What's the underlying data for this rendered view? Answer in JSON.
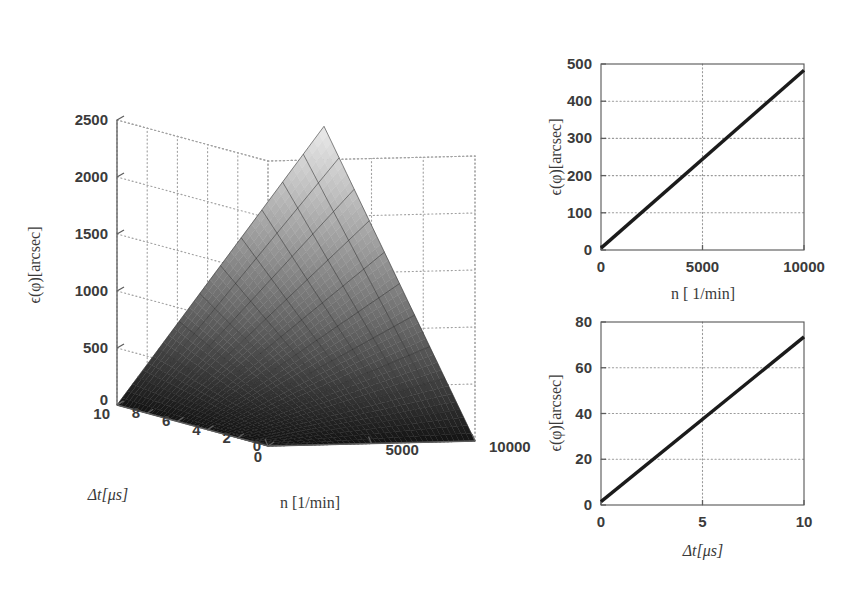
{
  "figure": {
    "background": "#ffffff",
    "panels": [
      "surface3d",
      "line_n",
      "line_dt"
    ]
  },
  "chart_data": [
    {
      "id": "surface3d",
      "type": "surface",
      "title": "",
      "xlabel": "n [1/min]",
      "ylabel": "Δt[μs]",
      "zlabel": "ϵ(φ)[arcsec]",
      "xlim": [
        0,
        10000
      ],
      "ylim": [
        0,
        10
      ],
      "zlim": [
        0,
        2500
      ],
      "xticks": [
        0,
        5000,
        10000
      ],
      "xticklabels": [
        "0",
        "5000",
        "10000"
      ],
      "yticks": [
        0,
        2,
        4,
        6,
        8,
        10
      ],
      "yticklabels": [
        "0",
        "2",
        "4",
        "6",
        "8",
        "10"
      ],
      "zticks": [
        0,
        500,
        1000,
        1500,
        2000,
        2500
      ],
      "zticklabels": [
        "0",
        "500",
        "1000",
        "1500",
        "2000",
        "2500"
      ],
      "grid": true,
      "colormap": "gray",
      "mesh_nx": 11,
      "mesh_ny": 11,
      "relation": "z = 0.02401 * n * dt  (arcsec); z(10000,10) = 2400",
      "surface_values_rows_dt_cols_n": [
        [
          0,
          0,
          0,
          0,
          0,
          0,
          0,
          0,
          0,
          0,
          0
        ],
        [
          0,
          24,
          48,
          72,
          96,
          120,
          144,
          168,
          192,
          216,
          240
        ],
        [
          0,
          48,
          96,
          144,
          192,
          240,
          288,
          336,
          384,
          432,
          480
        ],
        [
          0,
          72,
          144,
          216,
          288,
          360,
          432,
          504,
          576,
          648,
          720
        ],
        [
          0,
          96,
          192,
          288,
          384,
          480,
          576,
          672,
          768,
          864,
          960
        ],
        [
          0,
          120,
          240,
          360,
          480,
          600,
          720,
          840,
          960,
          1080,
          1200
        ],
        [
          0,
          144,
          288,
          432,
          576,
          720,
          864,
          1008,
          1152,
          1296,
          1440
        ],
        [
          0,
          168,
          336,
          504,
          672,
          840,
          1008,
          1176,
          1344,
          1512,
          1680
        ],
        [
          0,
          192,
          384,
          576,
          768,
          960,
          1152,
          1344,
          1536,
          1728,
          1920
        ],
        [
          0,
          216,
          432,
          648,
          864,
          1080,
          1296,
          1512,
          1728,
          1944,
          2160
        ],
        [
          0,
          240,
          480,
          720,
          960,
          1200,
          1440,
          1680,
          1920,
          2160,
          2400
        ]
      ],
      "n_values": [
        0,
        1000,
        2000,
        3000,
        4000,
        5000,
        6000,
        7000,
        8000,
        9000,
        10000
      ],
      "dt_values": [
        0,
        1,
        2,
        3,
        4,
        5,
        6,
        7,
        8,
        9,
        10
      ]
    },
    {
      "id": "line_n",
      "type": "line",
      "title": "",
      "xlabel": "n [ 1/min]",
      "ylabel": "ϵ(φ)[arcsec]",
      "xlim": [
        0,
        10000
      ],
      "ylim": [
        0,
        500
      ],
      "xticks": [
        0,
        5000,
        10000
      ],
      "xticklabels": [
        "0",
        "5000",
        "10000"
      ],
      "yticks": [
        0,
        100,
        200,
        300,
        400,
        500
      ],
      "yticklabels": [
        "0",
        "100",
        "200",
        "300",
        "400",
        "500"
      ],
      "grid": true,
      "series": [
        {
          "name": "epsilon vs n",
          "x": [
            0,
            10000
          ],
          "values": [
            5,
            483
          ]
        }
      ]
    },
    {
      "id": "line_dt",
      "type": "line",
      "title": "",
      "xlabel": "Δt[μs]",
      "ylabel": "ϵ(φ)[arcsec]",
      "xlim": [
        0,
        10
      ],
      "ylim": [
        0,
        80
      ],
      "xticks": [
        0,
        5,
        10
      ],
      "xticklabels": [
        "0",
        "5",
        "10"
      ],
      "yticks": [
        0,
        20,
        40,
        60,
        80
      ],
      "yticklabels": [
        "0",
        "20",
        "40",
        "60",
        "80"
      ],
      "grid": true,
      "series": [
        {
          "name": "epsilon vs delta t",
          "x": [
            0,
            10
          ],
          "values": [
            1.5,
            73.5
          ]
        }
      ]
    }
  ],
  "labels": {
    "epsilon_arcsec": "ϵ(φ)[arcsec]",
    "n_per_min": "n [1/min]",
    "n_per_min_sub": "n [ 1/min]",
    "delta_t_us": "Δt[μs]"
  }
}
